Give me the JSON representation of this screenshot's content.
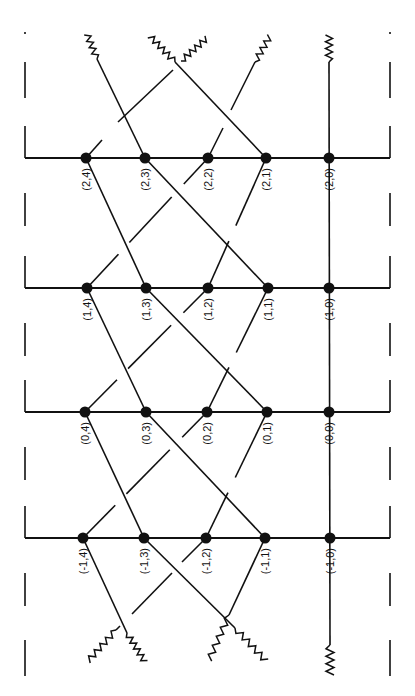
{
  "diagram": {
    "type": "lattice-graph",
    "colors": {
      "ink": "#111111",
      "background": "#ffffff"
    },
    "rows": [
      {
        "k": 2,
        "y": 158,
        "nodes": [
          {
            "label": "(2,4)",
            "x": 86
          },
          {
            "label": "(2,3)",
            "x": 145
          },
          {
            "label": "(2,2)",
            "x": 208
          },
          {
            "label": "(2,1)",
            "x": 266
          },
          {
            "label": "(2,0)",
            "x": 329
          }
        ]
      },
      {
        "k": 1,
        "y": 288,
        "nodes": [
          {
            "label": "(1,4)",
            "x": 87
          },
          {
            "label": "(1,3)",
            "x": 146
          },
          {
            "label": "(1,2)",
            "x": 208
          },
          {
            "label": "(1,1)",
            "x": 268
          },
          {
            "label": "(1,0)",
            "x": 329
          }
        ]
      },
      {
        "k": 0,
        "y": 412,
        "nodes": [
          {
            "label": "(0,4)",
            "x": 85
          },
          {
            "label": "(0,3)",
            "x": 146
          },
          {
            "label": "(0,2)",
            "x": 207
          },
          {
            "label": "(0,1)",
            "x": 267
          },
          {
            "label": "(0,0)",
            "x": 329
          }
        ]
      },
      {
        "k": -1,
        "y": 538,
        "nodes": [
          {
            "label": "(-1,4)",
            "x": 83
          },
          {
            "label": "(-1,3)",
            "x": 144
          },
          {
            "label": "(-1,2)",
            "x": 206
          },
          {
            "label": "(-1,1)",
            "x": 265
          },
          {
            "label": "(-1,0)",
            "x": 330
          }
        ]
      }
    ],
    "horizontal_extent": {
      "x1": 25,
      "x2": 390
    },
    "boundary_note": "dashed vertical lines on left and right edges"
  }
}
